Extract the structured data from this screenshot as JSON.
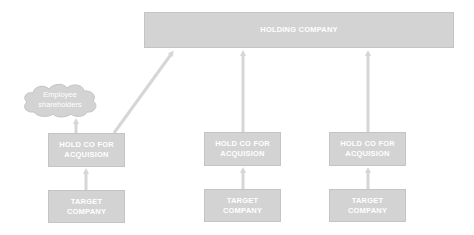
{
  "diagram": {
    "colors": {
      "box_fill": "#d3d3d3",
      "box_border": "#c4c4c4",
      "text": "#ffffff",
      "arrow": "#d6d6d6"
    },
    "holding_company": {
      "label": "HOLDING COMPANY"
    },
    "employee_shareholders": {
      "line1": "Employee",
      "line2": "shareholders",
      "shape": "cloud"
    },
    "branches": [
      {
        "hold_co": {
          "line1": "HOLD CO FOR",
          "line2": "ACQUISION"
        },
        "target": {
          "line1": "TARGET",
          "line2": "COMPANY"
        }
      },
      {
        "hold_co": {
          "line1": "HOLD CO FOR",
          "line2": "ACQUISION"
        },
        "target": {
          "line1": "TARGET",
          "line2": "COMPANY"
        }
      },
      {
        "hold_co": {
          "line1": "HOLD CO FOR",
          "line2": "ACQUISION"
        },
        "target": {
          "line1": "TARGET",
          "line2": "COMPANY"
        }
      }
    ],
    "edges": [
      {
        "from": "target-1",
        "to": "hold-co-1"
      },
      {
        "from": "target-2",
        "to": "hold-co-2"
      },
      {
        "from": "target-3",
        "to": "hold-co-3"
      },
      {
        "from": "hold-co-1",
        "to": "employee-shareholders"
      },
      {
        "from": "hold-co-1",
        "to": "holding-company"
      },
      {
        "from": "hold-co-2",
        "to": "holding-company"
      },
      {
        "from": "hold-co-3",
        "to": "holding-company"
      }
    ]
  }
}
